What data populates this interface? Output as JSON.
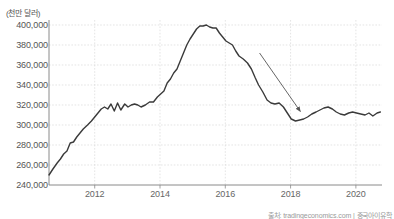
{
  "chart": {
    "unit_label": "(천만 달러)",
    "source_text": "출처: tradingeconomics.com | 중국아이유학"
  },
  "chart_data": {
    "type": "line",
    "title": "",
    "subtitle": "",
    "xlabel": "",
    "ylabel": "(천만 달러)",
    "grid": true,
    "legend": null,
    "xlim": [
      2010.6,
      2020.8
    ],
    "ylim": [
      240000,
      405000
    ],
    "x_ticks": [
      2012,
      2014,
      2016,
      2018,
      2020
    ],
    "y_ticks": [
      240000,
      260000,
      280000,
      300000,
      320000,
      340000,
      360000,
      380000,
      400000
    ],
    "y_tick_labels": [
      "240,000",
      "260,000",
      "280,000",
      "300,000",
      "320,000",
      "340,000",
      "360,000",
      "380,000",
      "400,000"
    ],
    "x_tick_labels": [
      "2012",
      "2014",
      "2016",
      "2018",
      "2020"
    ],
    "line_color": "#3a3a3a",
    "grid_color": "#d8d8d8",
    "axis_color": "#8a8a8a",
    "series": [
      {
        "name": "China holdings of US Treasury securities",
        "x": [
          2010.6,
          2010.72,
          2010.85,
          2010.95,
          2011.05,
          2011.15,
          2011.25,
          2011.35,
          2011.45,
          2011.55,
          2011.65,
          2011.78,
          2011.9,
          2012.0,
          2012.1,
          2012.2,
          2012.3,
          2012.4,
          2012.5,
          2012.6,
          2012.7,
          2012.8,
          2012.92,
          2013.02,
          2013.12,
          2013.22,
          2013.32,
          2013.42,
          2013.55,
          2013.68,
          2013.8,
          2013.92,
          2014.02,
          2014.12,
          2014.22,
          2014.32,
          2014.42,
          2014.52,
          2014.62,
          2014.72,
          2014.82,
          2014.92,
          2015.02,
          2015.12,
          2015.22,
          2015.32,
          2015.42,
          2015.52,
          2015.62,
          2015.72,
          2015.82,
          2015.92,
          2016.02,
          2016.12,
          2016.22,
          2016.32,
          2016.42,
          2016.55,
          2016.68,
          2016.8,
          2016.92,
          2017.02,
          2017.15,
          2017.28,
          2017.4,
          2017.52,
          2017.65,
          2017.78,
          2017.9,
          2018.02,
          2018.15,
          2018.28,
          2018.4,
          2018.52,
          2018.65,
          2018.78,
          2018.9,
          2019.02,
          2019.15,
          2019.28,
          2019.4,
          2019.52,
          2019.65,
          2019.78,
          2019.9,
          2020.02,
          2020.15,
          2020.28,
          2020.4,
          2020.52,
          2020.65,
          2020.75
        ],
        "values": [
          250000,
          256000,
          262000,
          266000,
          271000,
          274000,
          282000,
          283000,
          288000,
          292000,
          296000,
          300000,
          304000,
          308000,
          312000,
          316000,
          318000,
          316000,
          321000,
          314000,
          322000,
          315000,
          321000,
          318000,
          320000,
          321000,
          320000,
          318000,
          320000,
          323000,
          323000,
          328000,
          331000,
          334000,
          342000,
          346000,
          352000,
          356000,
          364000,
          372000,
          380000,
          386000,
          391000,
          396000,
          399000,
          399000,
          400000,
          398000,
          397000,
          397000,
          392000,
          388000,
          384000,
          382000,
          380000,
          374000,
          369000,
          366000,
          362000,
          356000,
          347000,
          340000,
          333000,
          325000,
          322000,
          321000,
          322000,
          318000,
          312000,
          306000,
          304000,
          305000,
          306000,
          308000,
          311000,
          313000,
          315000,
          317000,
          318000,
          316000,
          313000,
          311000,
          310000,
          312000,
          313000,
          312000,
          311000,
          310000,
          312000,
          309000,
          312000,
          313000
        ]
      }
    ],
    "annotations": [
      {
        "type": "arrow",
        "label": "",
        "from": {
          "x": 2017.05,
          "y": 372000
        },
        "to": {
          "x": 2018.3,
          "y": 313500
        },
        "color": "#555555",
        "description": "downward trend arrow pointing to the decline toward 2017-2018"
      }
    ]
  }
}
